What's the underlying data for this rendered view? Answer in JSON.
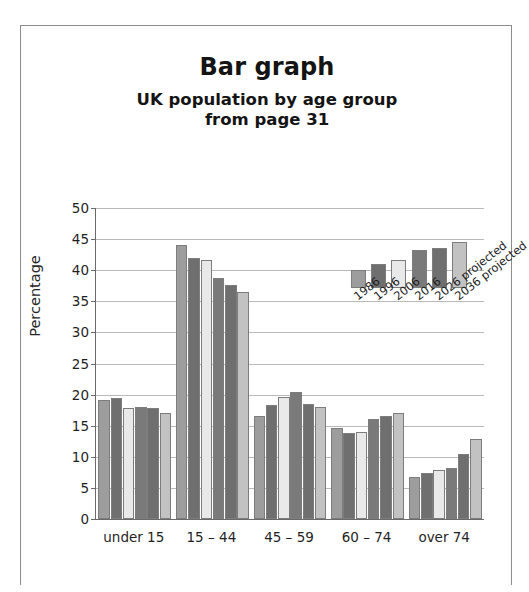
{
  "page": {
    "title": "Bar graph",
    "subtitle_line1": "UK population by age group",
    "subtitle_line2": "from page 31"
  },
  "chart_data": {
    "type": "bar",
    "title": "Bar graph",
    "subtitle": "UK population by age group from page 31",
    "xlabel": "",
    "ylabel": "Percentage",
    "ylim": [
      0,
      50
    ],
    "yticks": [
      0,
      5,
      10,
      15,
      20,
      25,
      30,
      35,
      40,
      45,
      50
    ],
    "grid": true,
    "legend_position": "inside-upper-right",
    "categories": [
      "under 15",
      "15 – 44",
      "45 – 59",
      "60 – 74",
      "over 74"
    ],
    "series": [
      {
        "name": "1986",
        "color": "#9d9d9d",
        "values": [
          19.2,
          44.0,
          16.6,
          14.6,
          6.8
        ]
      },
      {
        "name": "1996",
        "color": "#6f6f6f",
        "values": [
          19.4,
          42.0,
          18.3,
          13.9,
          7.4
        ]
      },
      {
        "name": "2006",
        "color": "#e9e9e9",
        "values": [
          17.9,
          41.7,
          19.6,
          14.0,
          7.8
        ]
      },
      {
        "name": "2016",
        "color": "#7a7a7a",
        "values": [
          18.0,
          38.7,
          20.4,
          16.0,
          8.2
        ]
      },
      {
        "name": "2026 projected",
        "color": "#6f6f6f",
        "values": [
          17.8,
          37.6,
          18.5,
          16.5,
          10.5
        ]
      },
      {
        "name": "2036 projected",
        "color": "#c2c2c2",
        "values": [
          17.0,
          36.5,
          18.0,
          17.0,
          12.8
        ]
      }
    ],
    "legend_swatch_heights": [
      18,
      24,
      28,
      38,
      40,
      46
    ]
  }
}
